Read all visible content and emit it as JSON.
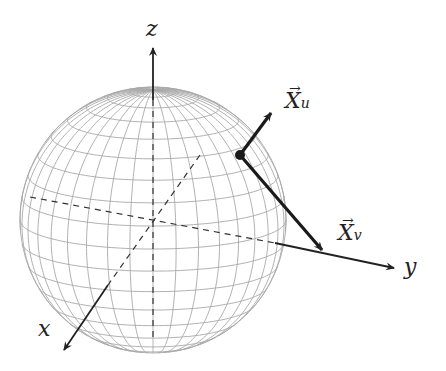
{
  "figure": {
    "axes": {
      "x_label": "x",
      "y_label": "y",
      "z_label": "z"
    },
    "vectors": [
      {
        "name": "X",
        "subscript": "u",
        "arrow": "→"
      },
      {
        "name": "X",
        "subscript": "v",
        "arrow": "→"
      }
    ],
    "colors": {
      "mesh": "#a8a8a8",
      "axis": "#222222",
      "background": "#ffffff"
    }
  }
}
